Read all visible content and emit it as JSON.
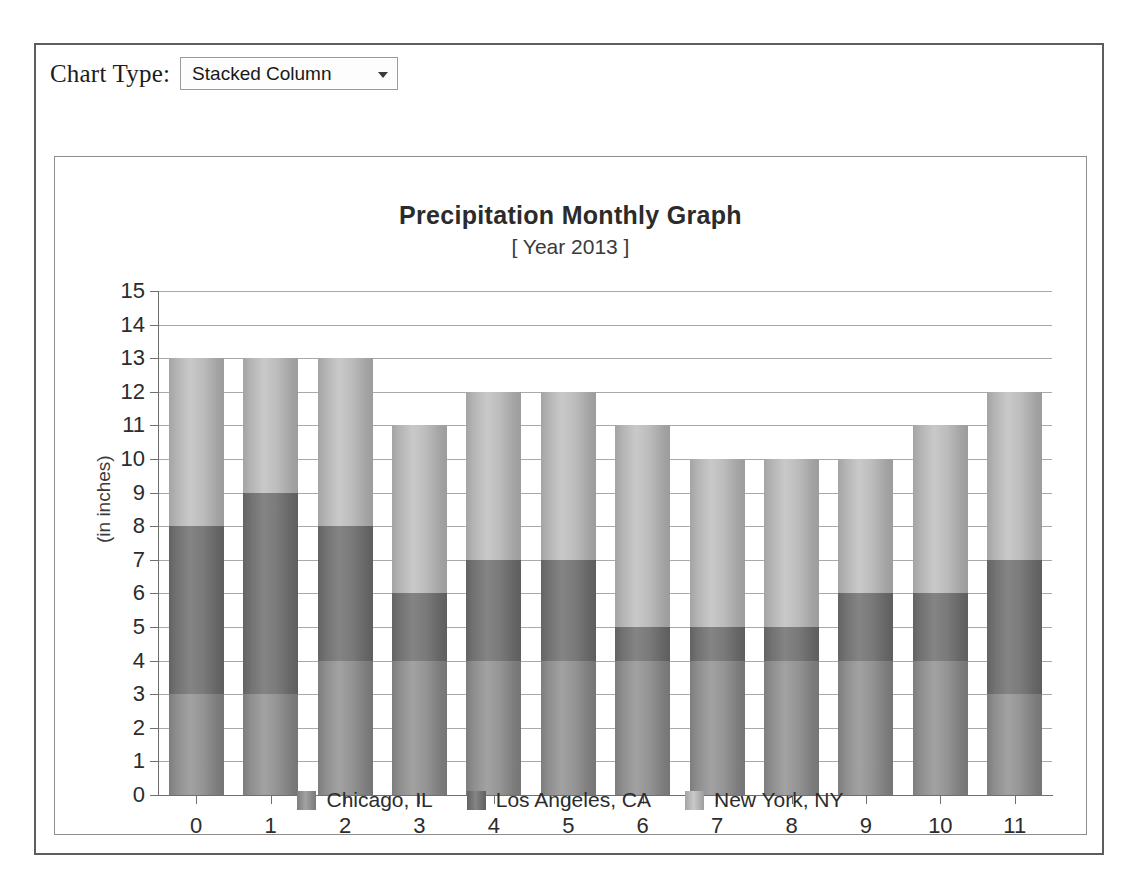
{
  "toolbar": {
    "chart_type_label": "Chart Type:",
    "chart_type_value": "Stacked Column",
    "chart_type_options": [
      "Stacked Column"
    ]
  },
  "chart_data": {
    "type": "bar",
    "stacked": true,
    "title": "Precipitation Monthly Graph",
    "subtitle": "[ Year 2013 ]",
    "xlabel": "",
    "ylabel": "(in inches)",
    "ylim": [
      0,
      15
    ],
    "ytick_step": 1,
    "grid": true,
    "legend_position": "bottom",
    "categories": [
      "0",
      "1",
      "2",
      "3",
      "4",
      "5",
      "6",
      "7",
      "8",
      "9",
      "10",
      "11"
    ],
    "yticks": [
      "0",
      "1",
      "2",
      "3",
      "4",
      "5",
      "6",
      "7",
      "8",
      "9",
      "10",
      "11",
      "12",
      "13",
      "14",
      "15"
    ],
    "series": [
      {
        "name": "Chicago, IL",
        "color": "#8e8e8e",
        "values": [
          3,
          3,
          4,
          4,
          4,
          4,
          4,
          4,
          4,
          4,
          4,
          3
        ]
      },
      {
        "name": "Los Angeles, CA",
        "color": "#727272",
        "values": [
          5,
          6,
          4,
          2,
          3,
          3,
          1,
          1,
          1,
          2,
          2,
          4
        ]
      },
      {
        "name": "New York, NY",
        "color": "#b4b4b4",
        "values": [
          5,
          4,
          5,
          5,
          5,
          5,
          6,
          5,
          5,
          4,
          5,
          5
        ]
      }
    ],
    "totals": [
      13,
      13,
      13,
      11,
      12,
      12,
      11,
      10,
      10,
      10,
      11,
      12
    ]
  }
}
